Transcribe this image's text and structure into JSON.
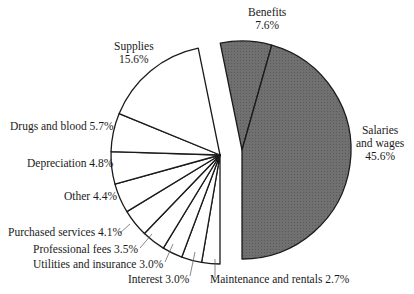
{
  "chart_data": {
    "type": "pie",
    "title": "",
    "slices": [
      {
        "label": "Salaries and wages",
        "value": 45.6,
        "group": "shaded"
      },
      {
        "label": "Benefits",
        "value": 7.6,
        "group": "shaded"
      },
      {
        "label": "Supplies",
        "value": 15.6,
        "group": "white"
      },
      {
        "label": "Drugs and blood",
        "value": 5.7,
        "group": "white"
      },
      {
        "label": "Depreciation",
        "value": 4.8,
        "group": "white"
      },
      {
        "label": "Other",
        "value": 4.4,
        "group": "white"
      },
      {
        "label": "Purchased services",
        "value": 4.1,
        "group": "white"
      },
      {
        "label": "Professional fees",
        "value": 3.5,
        "group": "white"
      },
      {
        "label": "Utilities and insurance",
        "value": 3.0,
        "group": "white"
      },
      {
        "label": "Interest",
        "value": 3.0,
        "group": "white"
      },
      {
        "label": "Maintenance and rentals",
        "value": 2.7,
        "group": "white"
      }
    ],
    "colors": {
      "shaded": "#6e6e6e",
      "white": "#ffffff",
      "stroke": "#1a1a1a"
    },
    "legend": "none (direct labels)"
  },
  "labels": {
    "benefits_name": "Benefits",
    "benefits_value": "7.6%",
    "salaries_line1": "Salaries",
    "salaries_line2": "and wages",
    "salaries_value": "45.6%",
    "supplies_name": "Supplies",
    "supplies_value": "15.6%",
    "drugs": "Drugs and blood 5.7%",
    "depreciation": "Depreciation 4.8%",
    "other": "Other 4.4%",
    "purchased": "Purchased services 4.1%",
    "professional": "Professional fees 3.5%",
    "utilities": "Utilities and insurance 3.0%",
    "interest": "Interest 3.0%",
    "maintenance": "Maintenance and rentals 2.7%"
  }
}
